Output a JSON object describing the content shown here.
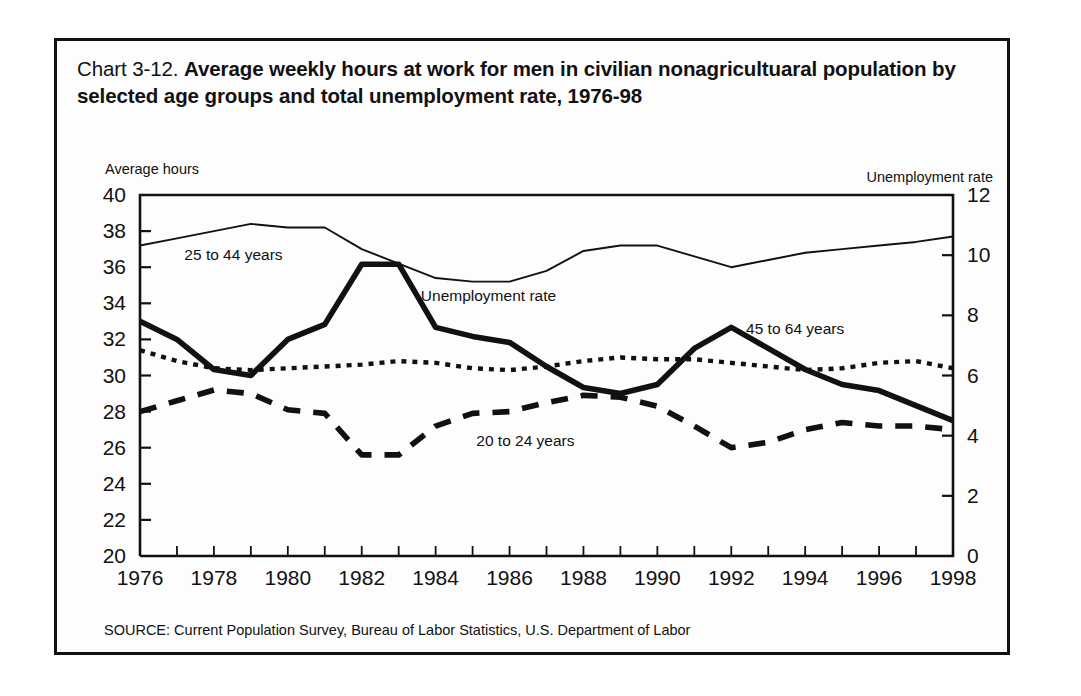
{
  "figure": {
    "chart_number": "Chart 3-12.",
    "title": "Average weekly hours at work for men in civilian nonagricultuaral population by selected age groups and total unemployment rate, 1976-98",
    "left_axis_caption": "Average hours",
    "right_axis_caption": "Unemployment rate",
    "source": "SOURCE: Current Population Survey, Bureau of Labor Statistics, U.S. Department of Labor",
    "ink_color": "#111111",
    "background_color": "#ffffff"
  },
  "chart_data": {
    "type": "line",
    "title": "Average weekly hours at work for men in civilian nonagricultuaral population by selected age groups and total unemployment rate, 1976-98",
    "xlabel": "",
    "ylabel": "Average hours",
    "y2label": "Unemployment rate",
    "xlim": [
      1976,
      1998
    ],
    "ylim": [
      20,
      40
    ],
    "y2lim": [
      0,
      12
    ],
    "yticks": [
      20,
      22,
      24,
      26,
      28,
      30,
      32,
      34,
      36,
      38,
      40
    ],
    "y2ticks": [
      0,
      2,
      4,
      6,
      8,
      10,
      12
    ],
    "xticks": [
      1976,
      1978,
      1980,
      1982,
      1984,
      1986,
      1988,
      1990,
      1992,
      1994,
      1996,
      1998
    ],
    "x_minor_ticks_every": 1,
    "grid": false,
    "legend_position": "inline-annotations",
    "x": [
      1976,
      1977,
      1978,
      1979,
      1980,
      1981,
      1982,
      1983,
      1984,
      1985,
      1986,
      1987,
      1988,
      1989,
      1990,
      1991,
      1992,
      1993,
      1994,
      1995,
      1996,
      1997,
      1998
    ],
    "series": [
      {
        "name": "25 to 44 years",
        "axis": "left",
        "units": "average weekly hours",
        "style": "thin-solid",
        "label_x": 1977.2,
        "label_y": 36.4,
        "values": [
          37.2,
          37.6,
          38.0,
          38.4,
          38.2,
          38.2,
          37.0,
          36.2,
          35.4,
          35.2,
          35.2,
          35.8,
          36.9,
          37.2,
          37.2,
          36.6,
          36.0,
          36.4,
          36.8,
          37.0,
          37.2,
          37.4,
          37.7
        ]
      },
      {
        "name": "20 to 24 years",
        "axis": "left",
        "units": "average weekly hours",
        "style": "thick-dashed",
        "label_x": 1985.1,
        "label_y": 26.1,
        "values": [
          28.0,
          28.6,
          29.2,
          29.0,
          28.1,
          27.9,
          25.6,
          25.6,
          27.2,
          27.9,
          28.0,
          28.5,
          28.9,
          28.8,
          28.3,
          27.2,
          26.0,
          26.3,
          27.0,
          27.4,
          27.2,
          27.2,
          27.0
        ]
      },
      {
        "name": "45 to 64 years",
        "axis": "left",
        "units": "average weekly hours",
        "style": "fine-dotted",
        "label_x": 1992.4,
        "label_y": 32.3,
        "values": [
          31.4,
          30.8,
          30.4,
          30.3,
          30.4,
          30.5,
          30.6,
          30.8,
          30.7,
          30.4,
          30.3,
          30.5,
          30.8,
          31.0,
          30.9,
          30.9,
          30.7,
          30.5,
          30.3,
          30.4,
          30.7,
          30.8,
          30.4
        ]
      },
      {
        "name": "Unemployment rate",
        "axis": "right",
        "units": "percent",
        "style": "thick-solid",
        "label_x": 1983.6,
        "label_y_right": 8.5,
        "values": [
          7.8,
          7.2,
          6.2,
          6.0,
          7.2,
          7.7,
          9.7,
          9.7,
          7.6,
          7.3,
          7.1,
          6.3,
          5.6,
          5.4,
          5.7,
          6.9,
          7.6,
          6.9,
          6.2,
          5.7,
          5.5,
          5.0,
          4.5
        ]
      }
    ],
    "annotations": [
      {
        "text": "25 to 44 years",
        "x": 1977.2,
        "y": 36.4
      },
      {
        "text": "Unemployment rate",
        "x": 1983.6,
        "y": 34.1
      },
      {
        "text": "20 to 24 years",
        "x": 1985.1,
        "y": 26.1
      },
      {
        "text": "45 to 64 years",
        "x": 1992.4,
        "y": 32.3
      }
    ]
  }
}
